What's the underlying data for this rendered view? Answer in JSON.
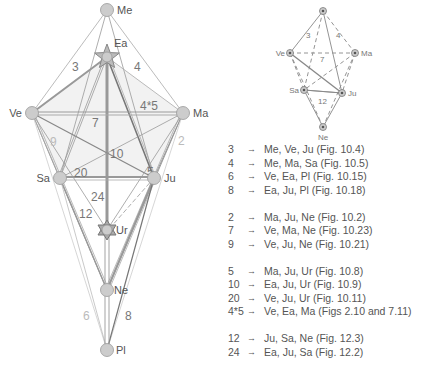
{
  "main_diagram": {
    "nodes": [
      {
        "id": "Me",
        "label": "Me",
        "x": 107,
        "y": 10,
        "shape": "circle"
      },
      {
        "id": "Ea",
        "label": "Ea",
        "x": 107,
        "y": 57,
        "shape": "star-pentagram"
      },
      {
        "id": "Ve",
        "label": "Ve",
        "x": 32,
        "y": 113,
        "shape": "circle"
      },
      {
        "id": "Ma",
        "label": "Ma",
        "x": 183,
        "y": 113,
        "shape": "circle"
      },
      {
        "id": "Sa",
        "label": "Sa",
        "x": 60,
        "y": 178,
        "shape": "circle"
      },
      {
        "id": "Ju",
        "label": "Ju",
        "x": 154,
        "y": 178,
        "shape": "circle"
      },
      {
        "id": "Ur",
        "label": "Ur",
        "x": 107,
        "y": 230,
        "shape": "star-hexagram"
      },
      {
        "id": "Ne",
        "label": "Ne",
        "x": 107,
        "y": 290,
        "shape": "circle"
      },
      {
        "id": "Pl",
        "label": "Pl",
        "x": 107,
        "y": 350,
        "shape": "circle"
      }
    ],
    "edge_labels": [
      {
        "text": "3",
        "x": 72,
        "y": 71,
        "light": false
      },
      {
        "text": "4",
        "x": 134,
        "y": 71,
        "light": false
      },
      {
        "text": "4*5",
        "x": 140,
        "y": 110,
        "light": false
      },
      {
        "text": "7",
        "x": 92,
        "y": 127,
        "light": false
      },
      {
        "text": "9",
        "x": 50,
        "y": 146,
        "light": true
      },
      {
        "text": "2",
        "x": 178,
        "y": 145,
        "light": true
      },
      {
        "text": "10",
        "x": 110,
        "y": 158,
        "light": false
      },
      {
        "text": "20",
        "x": 74,
        "y": 177,
        "light": false
      },
      {
        "text": "5",
        "x": 147,
        "y": 176,
        "light": false
      },
      {
        "text": "24",
        "x": 91,
        "y": 201,
        "light": false
      },
      {
        "text": "12",
        "x": 79,
        "y": 218,
        "light": false
      },
      {
        "text": "6",
        "x": 83,
        "y": 320,
        "light": true
      },
      {
        "text": "8",
        "x": 125,
        "y": 320,
        "light": false
      }
    ]
  },
  "small_diagram": {
    "nodes": [
      {
        "id": "Top",
        "label": "",
        "x": 323,
        "y": 11
      },
      {
        "id": "Ve",
        "label": "Ve",
        "x": 290,
        "y": 53
      },
      {
        "id": "Ma",
        "label": "Ma",
        "x": 355,
        "y": 53
      },
      {
        "id": "Sa",
        "label": "Sa",
        "x": 304,
        "y": 90
      },
      {
        "id": "Ju",
        "label": "Ju",
        "x": 342,
        "y": 93
      },
      {
        "id": "Ne",
        "label": "Ne",
        "x": 323,
        "y": 127
      }
    ],
    "edge_labels": [
      {
        "text": "3",
        "x": 306,
        "y": 38
      },
      {
        "text": "4",
        "x": 336,
        "y": 38
      },
      {
        "text": "7",
        "x": 320,
        "y": 62
      },
      {
        "text": "12",
        "x": 318,
        "y": 104
      }
    ]
  },
  "legend": {
    "arrow": "→",
    "groups": [
      [
        {
          "key": "3",
          "text": "Me, Ve, Ju (Fig. 10.4)"
        },
        {
          "key": "4",
          "text": "Me, Ma, Sa (Fig. 10.5)"
        },
        {
          "key": "6",
          "text": "Ve, Ea, Pl (Fig. 10.15)"
        },
        {
          "key": "8",
          "text": "Ea, Ju, Pl (Fig. 10.18)"
        }
      ],
      [
        {
          "key": "2",
          "text": "Ma, Ju, Ne (Fig. 10.2)"
        },
        {
          "key": "7",
          "text": "Ve, Ma, Ne (Fig. 10.23)"
        },
        {
          "key": "9",
          "text": "Ve, Ju, Ne (Fig. 10.21)"
        }
      ],
      [
        {
          "key": "5",
          "text": "Ma, Ju, Ur (Fig. 10.8)"
        },
        {
          "key": "10",
          "text": "Ea, Ju, Ur (Fig. 10.9)"
        },
        {
          "key": "20",
          "text": "Ve, Ju, Ur (Fig. 10.11)"
        },
        {
          "key": "4*5",
          "text": "Ve, Ea, Ma (Figs 2.10 and 7.11)"
        }
      ],
      [
        {
          "key": "12",
          "text": "Ju, Sa, Ne (Fig. 12.3)"
        },
        {
          "key": "24",
          "text": "Ea, Ju, Sa (Fig. 12.2)"
        }
      ]
    ]
  },
  "colors": {
    "line": "#999999",
    "line_dark": "#777777",
    "line_light": "#cccccc",
    "node_fill": "#cccccc",
    "node_stroke": "#999999",
    "text": "#555555"
  }
}
